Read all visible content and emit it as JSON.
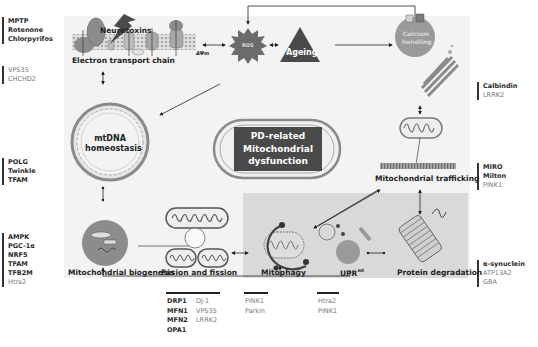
{
  "title": {
    "lines": [
      "PD-related",
      "Mitochondrial",
      "dysfunction"
    ]
  },
  "nodes": {
    "neurotoxins": "Neurotoxins",
    "etc": "Electron transport chain",
    "delta_psi": "ΔΨm",
    "ros": "ROS",
    "ageing": "Ageing",
    "calcium": [
      "Calcium",
      "handling"
    ],
    "mtdna": [
      "mtDNA",
      "homeostasis"
    ],
    "trafficking": "Mitochondrial trafficking",
    "biogenesis": "Mitochondrial biogenesis",
    "fusion": "Fusion and fission",
    "mitophagy": "Mitophagy",
    "uprmt": "UPR",
    "uprmt_sup": "mt",
    "protein_degradation": "Protein degradation"
  },
  "side_lists": {
    "toxins": {
      "bold": [
        "MPTP",
        "Rotenone",
        "Chlorpyrifos"
      ],
      "normal": []
    },
    "etc_genes": {
      "bold": [],
      "normal": [
        "VPS35",
        "CHCHD2"
      ]
    },
    "mtdna_genes": {
      "bold": [
        "POLG",
        "Twinkle",
        "TFAM"
      ],
      "normal": []
    },
    "biogenesis_genes": {
      "bold": [
        "AMPK",
        "PGC-1α",
        "NRF5",
        "TFAM",
        "TFB2M"
      ],
      "normal": [
        "Htra2"
      ]
    },
    "calcium_genes": {
      "bold": [
        "Calbindin"
      ],
      "normal": [
        "LRRK2"
      ]
    },
    "trafficking_genes": {
      "bold": [
        "MIRO",
        "Milton"
      ],
      "normal": [
        "PINK1"
      ]
    },
    "degradation_genes": {
      "bold": [
        "α-synuclein"
      ],
      "normal": [
        "ATP13A2",
        "GBA"
      ]
    }
  },
  "bottom_lists": {
    "fusion_bold": [
      "DRP1",
      "MFN1",
      "MFN2",
      "OPA1"
    ],
    "fusion_normal": [
      "DJ-1",
      "VPS35",
      "LRRK2"
    ],
    "mitophagy_normal": [
      "PINK1",
      "Parkin"
    ],
    "uprmt_normal": [
      "Htra2",
      "PINK1"
    ]
  },
  "colors": {
    "panel_bg": "#f3f3f3",
    "gray_zone": "#d9d9d9",
    "dark": "#4a4a4a",
    "mid": "#8c8c8c",
    "light": "#bdbdbd",
    "line": "#222222"
  }
}
